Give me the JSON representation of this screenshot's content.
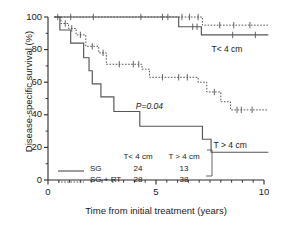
{
  "chart_data": {
    "type": "line",
    "title": "",
    "xlabel": "Time from initial treatment (years)",
    "ylabel": "Disease-specific survival (%)",
    "xlim": [
      0,
      10
    ],
    "ylim": [
      0,
      100
    ],
    "xticks": [
      0,
      5,
      10
    ],
    "xtick_labels": [
      "0",
      "5",
      "10"
    ],
    "yticks": [
      0,
      20,
      40,
      60,
      80,
      100
    ],
    "ytick_labels": [
      "0",
      "20",
      "40",
      "60",
      "80",
      "100"
    ],
    "xminor_step": 0.5,
    "yminor_step": 10,
    "grid": false,
    "legend_position": "inside-bottom-left",
    "annotations": [
      {
        "name": "p-value",
        "text": "P=0.04",
        "x": 4.9,
        "y": 45
      },
      {
        "name": "label-t-lt-4cm",
        "text": "T< 4 cm",
        "x": 8.4,
        "y": 80
      },
      {
        "name": "label-t-gt-4cm",
        "text": "T > 4 cm",
        "x": 8.5,
        "y": 21
      }
    ],
    "series": [
      {
        "name": "SG, T< 4 cm",
        "style": "solid",
        "color": "#555555",
        "group": "T< 4 cm",
        "treatment": "SG",
        "n": 24,
        "points": [
          [
            0.3,
            100
          ],
          [
            6.05,
            100
          ],
          [
            6.05,
            94
          ],
          [
            7.1,
            94
          ],
          [
            7.1,
            89
          ],
          [
            10.2,
            89
          ]
        ],
        "censor_marks": [
          [
            1.05,
            100
          ],
          [
            2.1,
            100
          ],
          [
            4.3,
            100
          ],
          [
            5.3,
            100
          ],
          [
            5.55,
            100
          ],
          [
            6.7,
            94
          ],
          [
            6.9,
            94
          ],
          [
            8.55,
            89
          ],
          [
            9.6,
            89
          ]
        ]
      },
      {
        "name": "SG + RT, T< 4 cm",
        "style": "dotted",
        "color": "#555555",
        "group": "T< 4 cm",
        "treatment": "SG + RT",
        "n": 28,
        "points": [
          [
            0.3,
            100
          ],
          [
            7.15,
            100
          ],
          [
            7.15,
            95
          ],
          [
            10.2,
            95
          ]
        ],
        "censor_marks": [
          [
            6.2,
            100
          ],
          [
            6.55,
            100
          ],
          [
            6.95,
            100
          ],
          [
            7.95,
            95
          ],
          [
            8.6,
            95
          ],
          [
            9.35,
            95
          ]
        ]
      },
      {
        "name": "SG, T > 4 cm",
        "style": "solid",
        "color": "#555555",
        "group": "T > 4 cm",
        "treatment": "SG",
        "n": 13,
        "points": [
          [
            0.3,
            100
          ],
          [
            0.55,
            100
          ],
          [
            0.55,
            92
          ],
          [
            1.05,
            92
          ],
          [
            1.05,
            84
          ],
          [
            1.65,
            84
          ],
          [
            1.65,
            75
          ],
          [
            1.9,
            75
          ],
          [
            1.9,
            67
          ],
          [
            2.05,
            67
          ],
          [
            2.05,
            59
          ],
          [
            2.45,
            59
          ],
          [
            2.45,
            51
          ],
          [
            3.05,
            51
          ],
          [
            3.05,
            42
          ],
          [
            4.25,
            42
          ],
          [
            4.25,
            33
          ],
          [
            7.15,
            33
          ],
          [
            7.15,
            25
          ],
          [
            7.55,
            25
          ],
          [
            7.55,
            17
          ],
          [
            10.2,
            17
          ]
        ],
        "censor_marks": []
      },
      {
        "name": "SG + RT, T > 4 cm",
        "style": "dotted",
        "color": "#555555",
        "group": "T > 4 cm",
        "treatment": "SG + RT",
        "n": 38,
        "points": [
          [
            0.3,
            100
          ],
          [
            0.6,
            100
          ],
          [
            0.6,
            96
          ],
          [
            0.95,
            96
          ],
          [
            0.95,
            93
          ],
          [
            1.3,
            93
          ],
          [
            1.3,
            89
          ],
          [
            1.75,
            89
          ],
          [
            1.75,
            82
          ],
          [
            2.35,
            82
          ],
          [
            2.35,
            78
          ],
          [
            2.7,
            78
          ],
          [
            2.7,
            71
          ],
          [
            4.35,
            71
          ],
          [
            4.35,
            68
          ],
          [
            4.7,
            68
          ],
          [
            4.7,
            63
          ],
          [
            6.95,
            63
          ],
          [
            6.95,
            60
          ],
          [
            7.35,
            60
          ],
          [
            7.35,
            54
          ],
          [
            8.0,
            54
          ],
          [
            8.0,
            48
          ],
          [
            8.45,
            48
          ],
          [
            8.45,
            43
          ],
          [
            10.2,
            43
          ]
        ],
        "censor_marks": [
          [
            0.45,
            100
          ],
          [
            0.8,
            96
          ],
          [
            1.1,
            93
          ],
          [
            1.5,
            89
          ],
          [
            2.05,
            82
          ],
          [
            2.55,
            78
          ],
          [
            3.3,
            71
          ],
          [
            3.95,
            71
          ],
          [
            4.2,
            71
          ],
          [
            5.3,
            63
          ],
          [
            6.05,
            63
          ],
          [
            6.45,
            63
          ],
          [
            7.7,
            54
          ],
          [
            8.75,
            43
          ],
          [
            8.95,
            43
          ],
          [
            9.45,
            43
          ]
        ]
      }
    ]
  },
  "legend": {
    "col_headers": [
      "T< 4 cm",
      "T > 4 cm"
    ],
    "rows": [
      {
        "label": "SG",
        "style": "solid",
        "values": [
          "24",
          "13"
        ]
      },
      {
        "label": "SG + RT",
        "style": "dotted",
        "values": [
          "28",
          "38"
        ]
      }
    ]
  }
}
